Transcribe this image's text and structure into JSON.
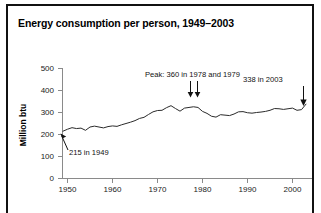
{
  "figure": {
    "title": "Energy consumption per person, 1949–2003",
    "frame_color": "#111111",
    "background": "#ffffff"
  },
  "axes": {
    "y_label": "Million btu",
    "y_ticks": [
      "0",
      "100",
      "200",
      "300",
      "400",
      "500"
    ],
    "x_ticks": [
      "1950",
      "1960",
      "1970",
      "1980",
      "1990",
      "2000"
    ]
  },
  "annotations": {
    "start": {
      "text": "215 in 1949",
      "arrow": "arrow-up-left",
      "value": 215,
      "year": 1949
    },
    "peak": {
      "text": "Peak: 360 in 1978 and 1979",
      "arrow": "double-arrow-down",
      "value": 360,
      "years": [
        1978,
        1979
      ]
    },
    "end": {
      "text": "338 in 2003",
      "arrow": "arrow-down",
      "value": 338,
      "year": 2003
    }
  },
  "chart_data": {
    "type": "line",
    "title": "Energy consumption per person, 1949–2003",
    "xlabel": "",
    "ylabel": "Million btu",
    "xlim": [
      1949,
      2003
    ],
    "ylim": [
      0,
      500
    ],
    "grid": false,
    "legend": null,
    "line_color": "#2b2b2b",
    "x": [
      1949,
      1950,
      1951,
      1952,
      1953,
      1954,
      1955,
      1956,
      1957,
      1958,
      1959,
      1960,
      1961,
      1962,
      1963,
      1964,
      1965,
      1966,
      1967,
      1968,
      1969,
      1970,
      1971,
      1972,
      1973,
      1974,
      1975,
      1976,
      1977,
      1978,
      1979,
      1980,
      1981,
      1982,
      1983,
      1984,
      1985,
      1986,
      1987,
      1988,
      1989,
      1990,
      1991,
      1992,
      1993,
      1994,
      1995,
      1996,
      1997,
      1998,
      1999,
      2000,
      2001,
      2002,
      2003
    ],
    "values": [
      215,
      224,
      231,
      227,
      229,
      219,
      234,
      238,
      234,
      230,
      236,
      239,
      237,
      244,
      250,
      256,
      263,
      273,
      278,
      291,
      303,
      309,
      310,
      322,
      331,
      318,
      306,
      320,
      323,
      326,
      323,
      305,
      296,
      283,
      279,
      290,
      288,
      286,
      293,
      303,
      304,
      299,
      297,
      300,
      302,
      305,
      310,
      318,
      317,
      314,
      317,
      320,
      310,
      313,
      338
    ]
  }
}
